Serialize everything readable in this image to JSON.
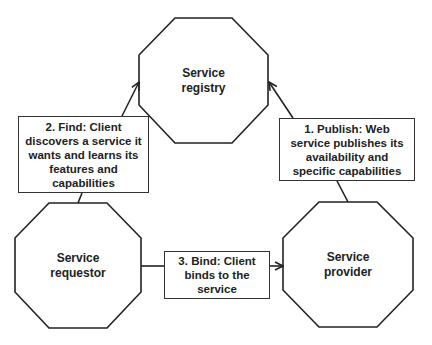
{
  "nodes": {
    "registry": {
      "line1": "Service",
      "line2": "registry"
    },
    "requestor": {
      "line1": "Service",
      "line2": "requestor"
    },
    "provider": {
      "line1": "Service",
      "line2": "provider"
    }
  },
  "labels": {
    "find": "2. Find: Client discovers a service it wants and learns its features and capabilities",
    "publish": "1. Publish: Web service publishes its availability and specific capabilities",
    "bind": "3. Bind: Client binds to the service"
  },
  "colors": {
    "stroke": "#222222",
    "background": "#ffffff"
  }
}
